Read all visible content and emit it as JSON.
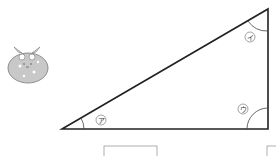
{
  "diagram": {
    "type": "right-triangle",
    "angles": [
      {
        "id": "a",
        "label": "ア",
        "position": "bottom-left"
      },
      {
        "id": "i",
        "label": "イ",
        "position": "top-right"
      },
      {
        "id": "u",
        "label": "ウ",
        "position": "bottom-right (right angle)"
      }
    ],
    "character": "mascot-bun-with-bow",
    "answer_boxes": 2
  },
  "colors": {
    "line": "#222222",
    "mascot_fill": "#c8c8c8",
    "box_border": "#999999"
  }
}
